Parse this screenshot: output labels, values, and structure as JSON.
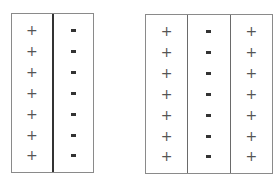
{
  "diagrams": [
    {
      "name": "two-column-capacitor",
      "columns": [
        {
          "symbols": [
            "+",
            "+",
            "+",
            "+",
            "+",
            "+",
            "+"
          ]
        },
        {
          "symbols": [
            "-",
            "-",
            "-",
            "-",
            "-",
            "-",
            "-"
          ]
        }
      ]
    },
    {
      "name": "three-column-capacitor",
      "columns": [
        {
          "symbols": [
            "+",
            "+",
            "+",
            "+",
            "+",
            "+",
            "+"
          ]
        },
        {
          "symbols": [
            "-",
            "-",
            "-",
            "-",
            "-",
            "-",
            "-"
          ]
        },
        {
          "symbols": [
            "+",
            "+",
            "+",
            "+",
            "+",
            "+",
            "+"
          ]
        }
      ]
    }
  ],
  "colors": {
    "border": "#8a8a8a",
    "divider": "#333333",
    "plus": "#555555",
    "minus": "#222222"
  }
}
